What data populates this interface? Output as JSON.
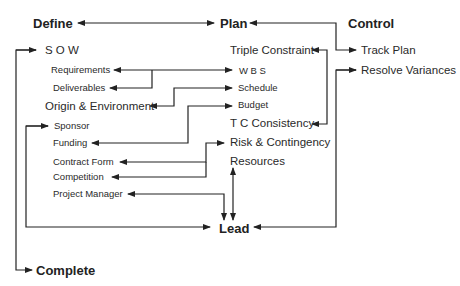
{
  "diagram": {
    "phases": {
      "define": "Define",
      "plan": "Plan",
      "control": "Control",
      "lead": "Lead",
      "complete": "Complete"
    },
    "define_items": {
      "sow": "S O W",
      "requirements": "Requirements",
      "deliverables": "Deliverables",
      "origin": "Origin & Environment",
      "sponsor": "Sponsor",
      "funding": "Funding",
      "contract_form": "Contract Form",
      "competition": "Competition",
      "project_manager": "Project Manager"
    },
    "plan_items": {
      "triple_constraint": "Triple Constraint",
      "wbs": "W B S",
      "schedule": "Schedule",
      "budget": "Budget",
      "tc_consistency": "T C Consistency",
      "risk": "Risk & Contingency",
      "resources": "Resources"
    },
    "control_items": {
      "track_plan": "Track Plan",
      "resolve_variances": "Resolve Variances"
    },
    "line_color": "#222222"
  }
}
